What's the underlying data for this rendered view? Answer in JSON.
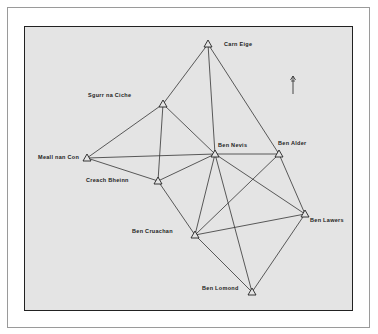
{
  "diagram": {
    "type": "triangulation-network",
    "north_arrow": {
      "symbol": "↑",
      "x": 293,
      "y": 86
    },
    "stations": [
      {
        "id": "carn-eige",
        "name": "Carn Eige",
        "x": 208,
        "y": 44,
        "label_x": 224,
        "label_y": 44
      },
      {
        "id": "sgurr-na-ciche",
        "name": "Sgurr na Ciche",
        "x": 163,
        "y": 104,
        "label_x": 88,
        "label_y": 95
      },
      {
        "id": "ben-nevis",
        "name": "Ben Nevis",
        "x": 215,
        "y": 154,
        "label_x": 218,
        "label_y": 145
      },
      {
        "id": "ben-alder",
        "name": "Ben Alder",
        "x": 279,
        "y": 154,
        "label_x": 278,
        "label_y": 143
      },
      {
        "id": "meall-nan-con",
        "name": "Meall nan Con",
        "x": 87,
        "y": 158,
        "label_x": 38,
        "label_y": 157
      },
      {
        "id": "creach-bheinn",
        "name": "Creach Bheinn",
        "x": 158,
        "y": 181,
        "label_x": 86,
        "label_y": 180
      },
      {
        "id": "ben-lawers",
        "name": "Ben Lawers",
        "x": 305,
        "y": 214,
        "label_x": 310,
        "label_y": 220
      },
      {
        "id": "ben-cruachan",
        "name": "Ben Cruachan",
        "x": 195,
        "y": 235,
        "label_x": 132,
        "label_y": 231
      },
      {
        "id": "ben-lomond",
        "name": "Ben Lomond",
        "x": 252,
        "y": 292,
        "label_x": 202,
        "label_y": 288
      }
    ],
    "edges": [
      [
        "carn-eige",
        "sgurr-na-ciche"
      ],
      [
        "carn-eige",
        "ben-nevis"
      ],
      [
        "carn-eige",
        "ben-alder"
      ],
      [
        "sgurr-na-ciche",
        "meall-nan-con"
      ],
      [
        "sgurr-na-ciche",
        "creach-bheinn"
      ],
      [
        "sgurr-na-ciche",
        "ben-nevis"
      ],
      [
        "meall-nan-con",
        "ben-nevis"
      ],
      [
        "meall-nan-con",
        "creach-bheinn"
      ],
      [
        "creach-bheinn",
        "ben-nevis"
      ],
      [
        "creach-bheinn",
        "ben-cruachan"
      ],
      [
        "ben-nevis",
        "ben-alder"
      ],
      [
        "ben-nevis",
        "ben-lawers"
      ],
      [
        "ben-nevis",
        "ben-cruachan"
      ],
      [
        "ben-nevis",
        "ben-lomond"
      ],
      [
        "ben-alder",
        "ben-lawers"
      ],
      [
        "ben-alder",
        "ben-cruachan"
      ],
      [
        "ben-lawers",
        "ben-cruachan"
      ],
      [
        "ben-lawers",
        "ben-lomond"
      ],
      [
        "ben-cruachan",
        "ben-lomond"
      ]
    ],
    "colors": {
      "panel": "#e4e4e4",
      "line": "#333333",
      "frame": "#9a9a9a",
      "border": "#222222"
    }
  }
}
